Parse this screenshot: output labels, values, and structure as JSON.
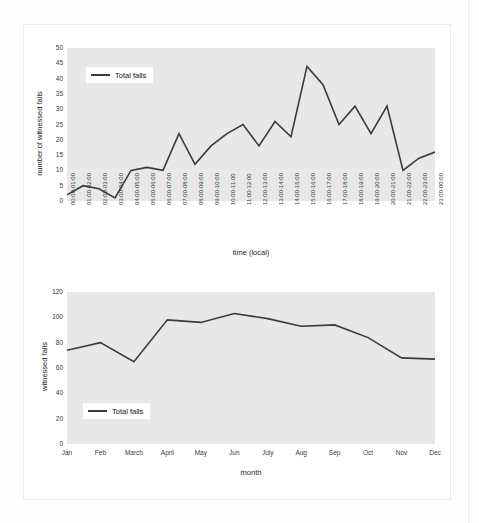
{
  "chart_data": [
    {
      "id": "hourly",
      "type": "line",
      "title": "",
      "xlabel": "time (local)",
      "ylabel": "number of witnessed falls",
      "ylim": [
        0,
        50
      ],
      "yticks": [
        0,
        5,
        10,
        15,
        20,
        25,
        30,
        35,
        40,
        45,
        50
      ],
      "grid": false,
      "legend": {
        "position": "upper-left",
        "entries": [
          "Total falls"
        ]
      },
      "series_name": "Total falls",
      "categories": [
        "00:00-01:00",
        "01:00-02:00",
        "02:00-03:00",
        "03:00-04:00",
        "04:00-05:00",
        "05:00-06:00",
        "06:00-07:00",
        "07:00-08:00",
        "08:00-09:00",
        "09:00-10:00",
        "10:00-11:00",
        "11:00-12:00",
        "12:00-13:00",
        "13:00-14:00",
        "14:00-15:00",
        "15:00-16:00",
        "16:00-17:00",
        "17:00-18:00",
        "18:00-19:00",
        "19:00-20:00",
        "20:00-21:00",
        "21:00-22:00",
        "22:00-23:00",
        "23:00-00:00"
      ],
      "values": [
        2,
        5,
        4,
        1,
        10,
        11,
        10,
        22,
        12,
        18,
        22,
        25,
        18,
        26,
        21,
        44,
        38,
        25,
        31,
        22,
        31,
        10,
        14,
        16
      ]
    },
    {
      "id": "monthly",
      "type": "line",
      "title": "",
      "xlabel": "month",
      "ylabel": "witnessed falls",
      "ylim": [
        0,
        120
      ],
      "yticks": [
        0,
        20,
        40,
        60,
        80,
        100,
        120
      ],
      "grid": false,
      "legend": {
        "position": "lower-left",
        "entries": [
          "Total falls"
        ]
      },
      "series_name": "Total falls",
      "categories": [
        "Jan",
        "Feb",
        "March",
        "April",
        "May",
        "Jun",
        "July",
        "Aug",
        "Sep",
        "Oct",
        "Nov",
        "Dec"
      ],
      "values": [
        74,
        80,
        65,
        98,
        96,
        103,
        99,
        93,
        94,
        84,
        68,
        67
      ]
    }
  ],
  "colors": {
    "line": "#3b3b3b",
    "plot_background": "#e8e8e8",
    "page_background": "#ffffff",
    "tick_text": "#3a3a3a",
    "axis_text": "#1c1c1c"
  }
}
